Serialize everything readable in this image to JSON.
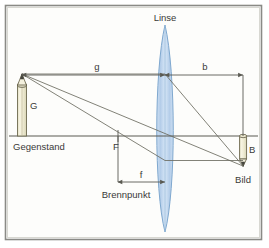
{
  "figure": {
    "language": "de",
    "background_color": "#fdfdfb",
    "border_color": "#8a8a86",
    "line_color": "#5a5a52",
    "ray_color": "#6b6b60",
    "lens_fill": "#bcd4ec",
    "lens_stroke": "#7fa8cf",
    "pencil_body_color": "#f2efd9",
    "pencil_outline_color": "#6e6a50",
    "text_color": "#3a3a38"
  },
  "labels": {
    "lens": "Linse",
    "object_height": "G",
    "object": "Gegenstand",
    "image_height": "B",
    "image": "Bild",
    "focal_point": "F",
    "focal_point_name": "Brennpunkt",
    "object_distance": "g",
    "image_distance": "b",
    "focal_length": "f"
  },
  "optics": {
    "optical_axis_y": 136,
    "lens_center_x": 165,
    "object_x": 22,
    "object_tip_y": 74,
    "image_x": 243,
    "image_tip_y": 166,
    "focal_point_x": 118,
    "g_label_position": "above-axis-left",
    "b_label_position": "above-axis-right",
    "f_label_position": "below-axis-left",
    "ray_count": 3,
    "lens_type": "biconvex-converging"
  },
  "geometry_notes": {
    "g_dimension_from_x": 22,
    "g_dimension_to_x": 165,
    "g_dimension_y": 75,
    "b_dimension_from_x": 165,
    "b_dimension_to_x": 243,
    "b_dimension_y": 75,
    "f_dimension_from_x": 118,
    "f_dimension_to_x": 165,
    "f_dimension_y": 182
  }
}
